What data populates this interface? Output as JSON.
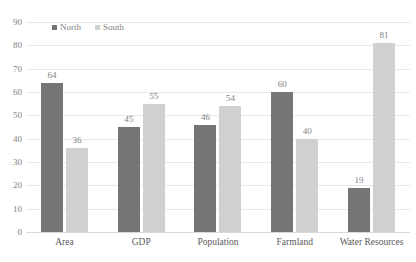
{
  "chart_data": {
    "type": "bar",
    "title": "",
    "subtitle": "",
    "xlabel": "",
    "ylabel": "",
    "categories": [
      "Area",
      "GDP",
      "Population",
      "Farmland",
      "Water Resources"
    ],
    "series": [
      {
        "name": "North",
        "color": "#757575",
        "values": [
          64,
          45,
          46,
          60,
          19
        ]
      },
      {
        "name": "South",
        "color": "#d0d0d0",
        "values": [
          36,
          55,
          54,
          40,
          81
        ]
      }
    ],
    "ylim": [
      0,
      90
    ],
    "ytick_step": 10,
    "yticks": [
      "90",
      "80",
      "70",
      "60",
      "50",
      "40",
      "30",
      "20",
      "10",
      "0"
    ],
    "grid": true,
    "legend_position": "top-left-inside",
    "data_labels": true
  },
  "legend": {
    "items": [
      {
        "label": "North",
        "swatch_name": "legend-swatch-north"
      },
      {
        "label": "South",
        "swatch_name": "legend-swatch-south"
      }
    ]
  },
  "colors": {
    "north": "#757575",
    "south": "#d0d0d0",
    "gridline": "#e8e8e8",
    "baseline": "#d9d9d9",
    "axis_text": "#7f7f7f",
    "category_text": "#595959",
    "background": "#ffffff"
  }
}
